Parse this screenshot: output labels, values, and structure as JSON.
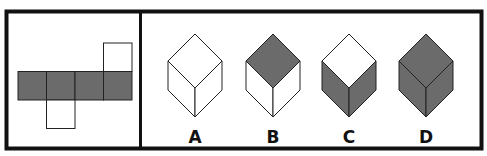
{
  "puzzle": {
    "net": {
      "description": "unfolded cube net: row of four faces with one face above the fourth and one face below the second",
      "faces": [
        {
          "id": "row-1",
          "fill": "gray"
        },
        {
          "id": "row-2",
          "fill": "gray"
        },
        {
          "id": "row-3",
          "fill": "gray"
        },
        {
          "id": "row-4",
          "fill": "gray"
        },
        {
          "id": "top-of-4",
          "fill": "white"
        },
        {
          "id": "bottom-of-2",
          "fill": "white"
        }
      ]
    },
    "options": [
      {
        "label": "A",
        "top": "white",
        "left": "white",
        "right": "white"
      },
      {
        "label": "B",
        "top": "gray",
        "left": "white",
        "right": "white"
      },
      {
        "label": "C",
        "top": "white",
        "left": "gray",
        "right": "gray"
      },
      {
        "label": "D",
        "top": "gray",
        "left": "gray",
        "right": "gray"
      }
    ],
    "colors": {
      "gray": "#6b6b6b",
      "white": "#ffffff",
      "stroke": "#222222",
      "frame": "#111111"
    }
  }
}
